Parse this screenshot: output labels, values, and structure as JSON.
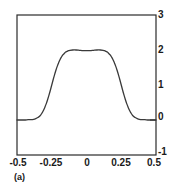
{
  "figure": {
    "caption": "(a)",
    "frame_color": "#2b2b2b",
    "curve_color": "#3a3a3a",
    "background": "#ffffff"
  },
  "chart_data": {
    "type": "line",
    "title": "",
    "xlabel": "",
    "ylabel": "",
    "xlim": [
      -0.5,
      0.5
    ],
    "ylim": [
      -1,
      3
    ],
    "grid": false,
    "legend": null,
    "annotations": [
      "(a)"
    ],
    "x_ticks": [
      -0.5,
      -0.25,
      0,
      0.25,
      0.5
    ],
    "x_tick_labels": [
      "-0.5",
      "-0.25",
      "0",
      "0.25",
      "0.5"
    ],
    "y_ticks": [
      -1,
      0,
      1,
      2,
      3
    ],
    "y_tick_labels": [
      "-1",
      "0",
      "1",
      "2",
      "3"
    ],
    "y_axis_side": "right",
    "series": [
      {
        "name": "flat-top pulse",
        "x": [
          -0.5,
          -0.48,
          -0.46,
          -0.44,
          -0.42,
          -0.4,
          -0.38,
          -0.365,
          -0.35,
          -0.34,
          -0.33,
          -0.32,
          -0.31,
          -0.3,
          -0.29,
          -0.28,
          -0.27,
          -0.26,
          -0.25,
          -0.24,
          -0.23,
          -0.22,
          -0.21,
          -0.2,
          -0.19,
          -0.18,
          -0.17,
          -0.16,
          -0.15,
          -0.14,
          -0.13,
          -0.12,
          -0.1,
          -0.075,
          -0.05,
          -0.025,
          0.0,
          0.025,
          0.05,
          0.075,
          0.1,
          0.12,
          0.13,
          0.14,
          0.15,
          0.16,
          0.17,
          0.18,
          0.19,
          0.2,
          0.21,
          0.22,
          0.23,
          0.24,
          0.25,
          0.26,
          0.27,
          0.28,
          0.29,
          0.3,
          0.31,
          0.32,
          0.33,
          0.34,
          0.35,
          0.365,
          0.38,
          0.4,
          0.42,
          0.44,
          0.46,
          0.48,
          0.5
        ],
        "y": [
          0.0,
          0.0,
          0.0,
          0.0,
          0.01,
          0.01,
          0.02,
          0.04,
          0.07,
          0.1,
          0.14,
          0.2,
          0.27,
          0.36,
          0.46,
          0.58,
          0.71,
          0.85,
          1.0,
          1.15,
          1.29,
          1.42,
          1.54,
          1.64,
          1.73,
          1.8,
          1.86,
          1.9,
          1.94,
          1.96,
          1.98,
          1.99,
          2.0,
          2.0,
          1.99,
          1.98,
          1.98,
          1.98,
          1.99,
          2.0,
          2.0,
          1.99,
          1.98,
          1.96,
          1.94,
          1.9,
          1.86,
          1.8,
          1.73,
          1.64,
          1.54,
          1.42,
          1.29,
          1.15,
          1.0,
          0.85,
          0.71,
          0.58,
          0.46,
          0.36,
          0.27,
          0.2,
          0.14,
          0.1,
          0.07,
          0.04,
          0.02,
          0.01,
          0.01,
          0.0,
          0.0,
          0.0,
          0.0
        ]
      }
    ]
  },
  "axes_geometry": {
    "left_px": 17,
    "right_px": 156,
    "top_px": 15,
    "bottom_px": 155
  }
}
